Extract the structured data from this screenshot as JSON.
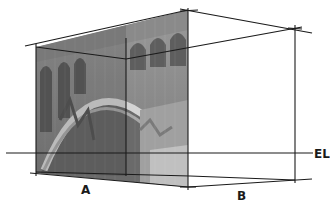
{
  "figure": {
    "labels": {
      "a": "A",
      "b": "B",
      "eye_level": "EL"
    },
    "colors": {
      "line": "#1a1a1a",
      "photo_dark": "#6e6e6e",
      "photo_mid": "#8c8c8c",
      "photo_light": "#c8c8c8",
      "background": "#ffffff"
    }
  }
}
